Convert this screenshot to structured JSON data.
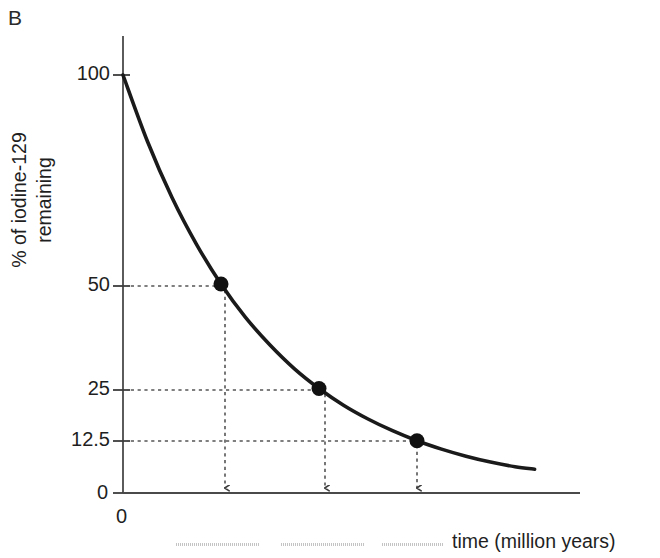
{
  "panel": {
    "label": "B"
  },
  "axes": {
    "ylabel_line1": "% of iodine-129",
    "ylabel_line2": "remaining",
    "xlabel": "time (million years)",
    "y_origin_label": "0",
    "x_origin_label": "0"
  },
  "chart_data": {
    "type": "line",
    "title": "",
    "subtitle": "",
    "xlabel": "time (million years)",
    "ylabel": "% of iodine-129 remaining",
    "grid": false,
    "legend": null,
    "curve_model": "exponential decay, N = 100 * 0.5^(t / half_life)",
    "half_life_units": "million years",
    "ylim": [
      0,
      100
    ],
    "y_ticks": [
      0,
      12.5,
      25,
      50,
      100
    ],
    "y_tick_labels": [
      "0",
      "12.5",
      "25",
      "50",
      "100"
    ],
    "xlim": [
      0,
      4.4
    ],
    "x_ticks_visible": false,
    "x_tick_labels_redacted": [
      "",
      "",
      ""
    ],
    "x_tick_labels_note": "three x-axis tick labels are blurred/redacted in the source image",
    "series": [
      {
        "name": "iodine-129 remaining",
        "x": [
          0.0,
          0.25,
          0.5,
          0.75,
          1.0,
          1.25,
          1.5,
          1.75,
          2.0,
          2.25,
          2.5,
          2.75,
          3.0,
          3.25,
          3.5,
          3.75,
          4.0,
          4.2
        ],
        "values": [
          100.0,
          84.1,
          70.7,
          59.5,
          50.0,
          42.0,
          35.4,
          29.7,
          25.0,
          21.0,
          17.7,
          14.9,
          12.5,
          10.5,
          8.8,
          7.4,
          6.3,
          5.7
        ]
      }
    ],
    "annotated_points": [
      {
        "label": "1 half-life",
        "x": 1.0,
        "y": 50.0,
        "y_label": "50"
      },
      {
        "label": "2 half-lives",
        "x": 2.0,
        "y": 25.0,
        "y_label": "25"
      },
      {
        "label": "3 half-lives",
        "x": 3.0,
        "y": 12.5,
        "y_label": "12.5"
      }
    ],
    "annotations": {
      "guide_lines": "dotted horizontal lines from y-axis to each marked point, dotted vertical arrows from each point down to the x-axis",
      "arrow_direction": "down"
    },
    "colors": {
      "curve": "#1a1a1a",
      "marker": "#111111",
      "axis": "#4a4a4a",
      "guide": "#555555",
      "text": "#1f1f1f",
      "background": "#ffffff"
    }
  }
}
